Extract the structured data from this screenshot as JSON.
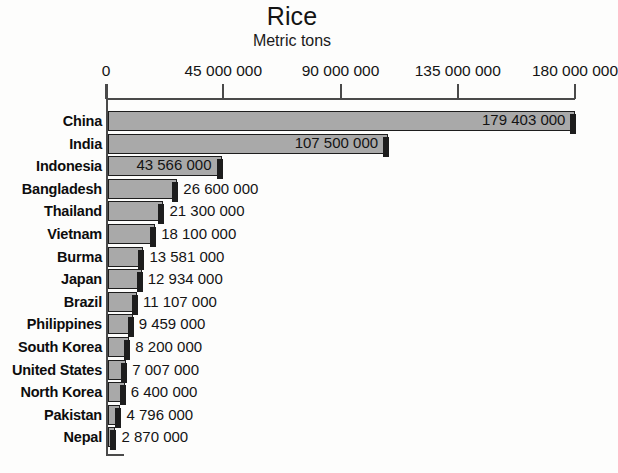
{
  "chart_data": {
    "type": "bar",
    "orientation": "horizontal",
    "title": "Rice",
    "subtitle": "Metric tons",
    "xlabel": "",
    "ylabel": "",
    "xlim": [
      0,
      190000000
    ],
    "grid": false,
    "legend": null,
    "tick_labels": [
      "0",
      "45 000 000",
      "90 000 000",
      "135 000 000",
      "180 000 000"
    ],
    "tick_values": [
      0,
      45000000,
      90000000,
      135000000,
      180000000
    ],
    "categories": [
      "China",
      "India",
      "Indonesia",
      "Bangladesh",
      "Thailand",
      "Vietnam",
      "Burma",
      "Japan",
      "Brazil",
      "Philippines",
      "South Korea",
      "United States",
      "North Korea",
      "Pakistan",
      "Nepal"
    ],
    "values": [
      179403000,
      107500000,
      43566000,
      26600000,
      21300000,
      18100000,
      13581000,
      12934000,
      11107000,
      9459000,
      8200000,
      7007000,
      6400000,
      4796000,
      2870000
    ],
    "value_labels": [
      "179 403 000",
      "107 500 000",
      "43 566 000",
      "26 600 000",
      "21 300 000",
      "18 100 000",
      "13 581 000",
      "12 934 000",
      "11 107 000",
      "9 459 000",
      "8 200 000",
      "7 007 000",
      "6 400 000",
      "4 796 000",
      "2 870 000"
    ],
    "label_inside": [
      true,
      true,
      true,
      false,
      false,
      false,
      false,
      false,
      false,
      false,
      false,
      false,
      false,
      false,
      false
    ],
    "colors": {
      "bar_fill": "#a9a9a9",
      "bar_border": "#1d1d1d",
      "axis": "#4a4a4a",
      "text": "#141414",
      "background": "#fdfdfc"
    }
  }
}
